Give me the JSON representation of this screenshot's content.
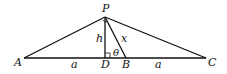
{
  "diagram": {
    "type": "geometry-triangle",
    "points": {
      "P": {
        "label": "P",
        "x": 105,
        "y": 17
      },
      "A": {
        "label": "A",
        "x": 24,
        "y": 58
      },
      "C": {
        "label": "C",
        "x": 206,
        "y": 58
      },
      "D": {
        "label": "D",
        "x": 105,
        "y": 58
      },
      "B": {
        "label": "B",
        "x": 126,
        "y": 58
      }
    },
    "segment_labels": {
      "h": "h",
      "x": "x",
      "theta": "θ",
      "a_left": "a",
      "a_right": "a"
    },
    "colors": {
      "stroke": "#111111",
      "background": "#ffffff"
    }
  }
}
